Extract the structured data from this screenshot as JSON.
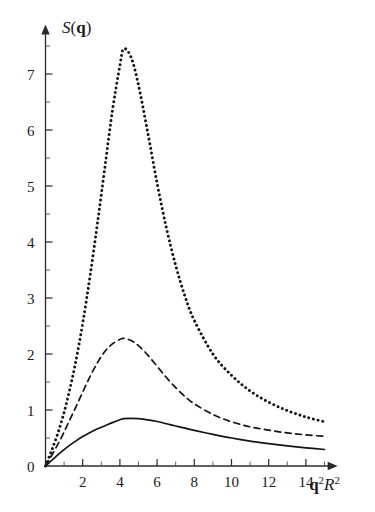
{
  "figure": {
    "background_color": "#ffffff",
    "ink_color": "#141414"
  },
  "axes": {
    "y_title": "S(q)",
    "y_title_parts": {
      "symbol": "S",
      "open": "(",
      "vector": "q",
      "close": ")"
    },
    "x_title": "q2R2",
    "x_title_parts": {
      "q": "q",
      "q_exp": "2",
      "R": "R",
      "R_exp": "2"
    },
    "y_tick_labels": [
      "0",
      "1",
      "2",
      "3",
      "4",
      "5",
      "6",
      "7"
    ],
    "y_tick_values": [
      0,
      1,
      2,
      3,
      4,
      5,
      6,
      7
    ],
    "y_minor_step": 0.5,
    "x_tick_labels": [
      "2",
      "4",
      "6",
      "8",
      "10",
      "12",
      "14"
    ],
    "x_tick_values": [
      2,
      4,
      6,
      8,
      10,
      12,
      14
    ],
    "x_minor_step": 1,
    "has_arrow_heads": true,
    "grid": false
  },
  "chart_data": {
    "type": "line",
    "title": "",
    "subtitle": "",
    "xlabel": "q2R2",
    "ylabel": "S(q)",
    "xlim": [
      0,
      15.6
    ],
    "ylim": [
      0,
      7.85
    ],
    "grid": false,
    "legend": "none",
    "annotations": [],
    "series": [
      {
        "name": "solid",
        "style": "solid",
        "peak_x": 4.2,
        "peak_y": 0.85,
        "x": [
          0,
          0.3,
          0.6,
          0.9,
          1.2,
          1.6,
          2.0,
          2.4,
          2.8,
          3.2,
          3.6,
          4.0,
          4.2,
          4.6,
          5.0,
          5.5,
          6.0,
          6.5,
          7.0,
          7.5,
          8.0,
          9.0,
          10.0,
          11.0,
          12.0,
          13.0,
          14.0,
          15.0
        ],
        "y": [
          0,
          0.09,
          0.18,
          0.265,
          0.345,
          0.44,
          0.525,
          0.6,
          0.665,
          0.72,
          0.775,
          0.825,
          0.845,
          0.85,
          0.845,
          0.825,
          0.795,
          0.755,
          0.715,
          0.675,
          0.635,
          0.565,
          0.5,
          0.445,
          0.4,
          0.36,
          0.325,
          0.295
        ]
      },
      {
        "name": "dashed",
        "style": "dashed",
        "peak_x": 4.2,
        "peak_y": 2.28,
        "x": [
          0,
          0.3,
          0.6,
          0.9,
          1.2,
          1.6,
          2.0,
          2.4,
          2.8,
          3.2,
          3.6,
          4.0,
          4.2,
          4.6,
          5.0,
          5.5,
          6.0,
          6.5,
          7.0,
          7.5,
          8.0,
          9.0,
          10.0,
          11.0,
          12.0,
          13.0,
          14.0,
          15.0
        ],
        "y": [
          0,
          0.17,
          0.35,
          0.54,
          0.75,
          1.03,
          1.32,
          1.6,
          1.85,
          2.05,
          2.18,
          2.26,
          2.28,
          2.24,
          2.15,
          1.98,
          1.78,
          1.58,
          1.4,
          1.24,
          1.11,
          0.92,
          0.79,
          0.7,
          0.64,
          0.59,
          0.555,
          0.53
        ]
      },
      {
        "name": "dotted",
        "style": "dotted",
        "peak_x": 4.2,
        "peak_y": 7.45,
        "x": [
          0,
          0.3,
          0.6,
          0.9,
          1.2,
          1.6,
          2.0,
          2.4,
          2.8,
          3.2,
          3.6,
          4.0,
          4.2,
          4.6,
          5.0,
          5.5,
          6.0,
          6.5,
          7.0,
          7.5,
          8.0,
          9.0,
          10.0,
          11.0,
          12.0,
          13.0,
          14.0,
          15.0
        ],
        "y": [
          0,
          0.25,
          0.52,
          0.84,
          1.22,
          1.82,
          2.55,
          3.4,
          4.35,
          5.35,
          6.35,
          7.15,
          7.45,
          7.3,
          6.8,
          5.95,
          5.05,
          4.25,
          3.58,
          3.03,
          2.6,
          2.0,
          1.62,
          1.34,
          1.14,
          0.99,
          0.875,
          0.79
        ]
      }
    ]
  }
}
